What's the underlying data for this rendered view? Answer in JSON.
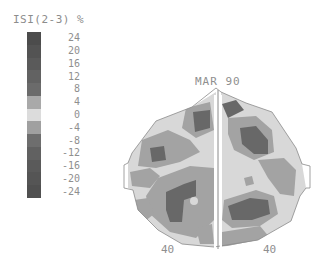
{
  "scale": {
    "title": "ISI(2-3) %",
    "ticks": [
      "24",
      "20",
      "16",
      "12",
      "8",
      "4",
      "0",
      "-4",
      "-8",
      "-12",
      "-16",
      "-20",
      "-24"
    ],
    "colors": [
      "#4c4c4c",
      "#535353",
      "#5a5a5a",
      "#626262",
      "#6b6b6b",
      "#a9a9a9",
      "#dcdcdc",
      "#a0a0a0",
      "#6e6e6e",
      "#616161",
      "#5a5a5a",
      "#555555",
      "#505050"
    ]
  },
  "map": {
    "label": "MAR 90",
    "left_hemisphere_value": "40",
    "right_hemisphere_value": "40",
    "palette": {
      "light": "#d8d8d8",
      "medium": "#a3a3a3",
      "dark": "#686868"
    }
  }
}
